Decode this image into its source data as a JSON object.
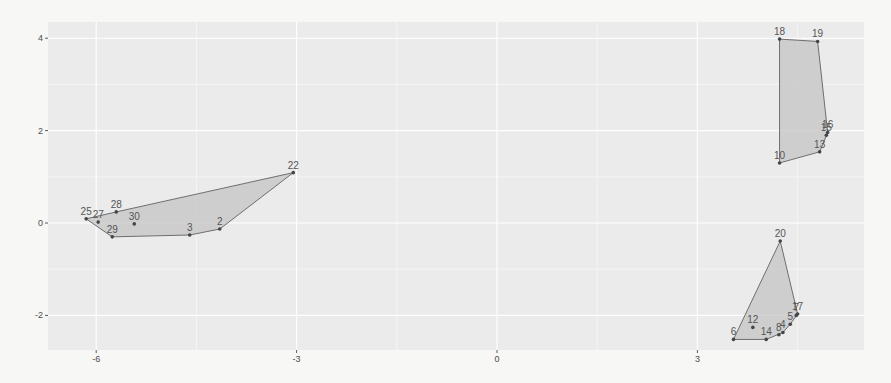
{
  "chart_data": {
    "type": "scatter",
    "title": "",
    "xlabel": "",
    "ylabel": "",
    "xlim": [
      -6.7,
      5.5
    ],
    "ylim": [
      -2.75,
      4.35
    ],
    "x_ticks": [
      -6,
      -3,
      0,
      3
    ],
    "x_tick_labels": [
      "-6",
      "-3",
      "0",
      "3"
    ],
    "y_ticks": [
      -2,
      0,
      2,
      4
    ],
    "y_tick_labels": [
      "-2",
      "0",
      "2",
      "4"
    ],
    "grid": true,
    "legend": "none",
    "colors": {
      "panel_bg": "#ebebeb",
      "grid": "#ffffff",
      "hull_fill": "#c4c4c4",
      "hull_stroke": "#6e6e6e",
      "point": "#444444"
    },
    "points": [
      {
        "id": "2",
        "x": -4.15,
        "y": -0.13
      },
      {
        "id": "3",
        "x": -4.6,
        "y": -0.26
      },
      {
        "id": "22",
        "x": -3.05,
        "y": 1.09
      },
      {
        "id": "25",
        "x": -6.15,
        "y": 0.09
      },
      {
        "id": "27",
        "x": -5.97,
        "y": 0.02
      },
      {
        "id": "28",
        "x": -5.7,
        "y": 0.24
      },
      {
        "id": "29",
        "x": -5.76,
        "y": -0.3
      },
      {
        "id": "30",
        "x": -5.43,
        "y": -0.02
      },
      {
        "id": "10",
        "x": 4.23,
        "y": 1.3
      },
      {
        "id": "13",
        "x": 4.83,
        "y": 1.54
      },
      {
        "id": "15",
        "x": 4.93,
        "y": 1.9
      },
      {
        "id": "16",
        "x": 4.95,
        "y": 1.96
      },
      {
        "id": "18",
        "x": 4.23,
        "y": 3.98
      },
      {
        "id": "19",
        "x": 4.8,
        "y": 3.93
      },
      {
        "id": "4",
        "x": 4.28,
        "y": -2.37
      },
      {
        "id": "5",
        "x": 4.39,
        "y": -2.19
      },
      {
        "id": "6",
        "x": 3.54,
        "y": -2.52
      },
      {
        "id": "7",
        "x": 4.48,
        "y": -2.0
      },
      {
        "id": "8",
        "x": 4.22,
        "y": -2.42
      },
      {
        "id": "12",
        "x": 3.83,
        "y": -2.26
      },
      {
        "id": "14",
        "x": 4.03,
        "y": -2.52
      },
      {
        "id": "17",
        "x": 4.5,
        "y": -1.97
      },
      {
        "id": "20",
        "x": 4.24,
        "y": -0.39
      }
    ],
    "hulls": [
      {
        "name": "cluster-left",
        "vertices": [
          "25",
          "29",
          "3",
          "2",
          "22",
          "28"
        ]
      },
      {
        "name": "cluster-upper-right",
        "vertices": [
          "18",
          "19",
          "16",
          "13",
          "10"
        ]
      },
      {
        "name": "cluster-lower-right",
        "vertices": [
          "20",
          "17",
          "5",
          "4",
          "14",
          "6"
        ]
      }
    ]
  }
}
